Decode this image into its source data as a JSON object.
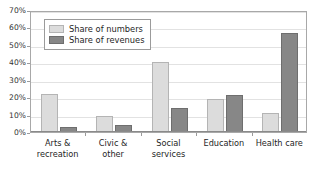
{
  "chart_data": {
    "type": "bar",
    "title": "",
    "subtitle": "",
    "xlabel": "",
    "ylabel": "",
    "categories": [
      "Arts &\nrecreation",
      "Civic &\nother",
      "Social services",
      "Education",
      "Health care"
    ],
    "series": [
      {
        "name": "Share of numbers",
        "color": "#dcdcdc",
        "values": [
          22,
          9,
          40,
          19,
          11
        ]
      },
      {
        "name": "Share of revenues",
        "color": "#878787",
        "values": [
          3,
          4,
          14,
          21,
          57
        ]
      }
    ],
    "ylim": [
      0,
      70
    ],
    "ytick_values": [
      0,
      10,
      20,
      30,
      40,
      50,
      60,
      70
    ],
    "ytick_labels": [
      "0%",
      "10%",
      "20%",
      "30%",
      "40%",
      "50%",
      "60%",
      "70%"
    ],
    "grid": true,
    "grid_axis": "y",
    "legend_position": "upper-left-inside",
    "legend_entries": [
      "Share of numbers",
      "Share of revenues"
    ],
    "annotations": []
  },
  "colors": {
    "series_numbers": "#dcdcdc",
    "series_revenues": "#878787",
    "gridline": "#e2e2e2",
    "frame": "#a8a8a8",
    "text": "#262626",
    "background": "#ffffff"
  }
}
